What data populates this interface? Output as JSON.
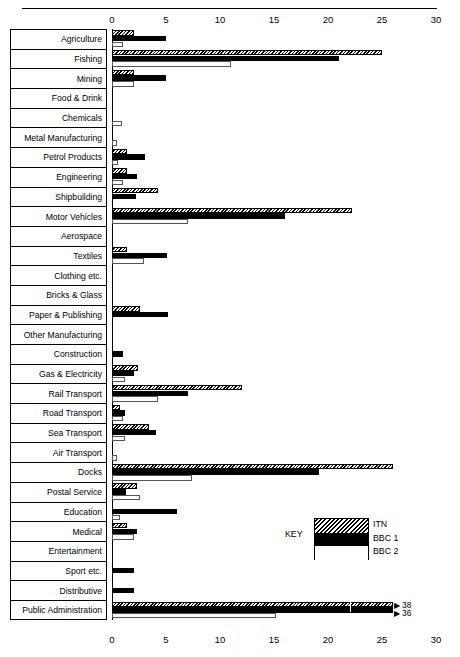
{
  "chart_data": {
    "type": "bar",
    "orientation": "horizontal",
    "title": "",
    "subtitle": "",
    "xlabel": "",
    "ylabel": "",
    "xlim": [
      0,
      30
    ],
    "xticks": [
      0,
      5,
      10,
      15,
      20,
      25,
      30
    ],
    "xtick_labels": [
      "0",
      "5",
      "10",
      "15",
      "20",
      "25",
      "30"
    ],
    "grid": false,
    "legend_position": "inside-right",
    "legend_title": "KEY",
    "categories": [
      "Agriculture",
      "Fishing",
      "Mining",
      "Food & Drink",
      "Chemicals",
      "Metal Manufacturing",
      "Petrol Products",
      "Engineering",
      "Shipbuilding",
      "Motor Vehicles",
      "Aerospace",
      "Textiles",
      "Clothing etc.",
      "Bricks & Glass",
      "Paper & Publishing",
      "Other Manufacturing",
      "Construction",
      "Gas & Electricity",
      "Rail Transport",
      "Road Transport",
      "Sea Transport",
      "Air Transport",
      "Docks",
      "Postal Service",
      "Education",
      "Medical",
      "Entertainment",
      "Sport etc.",
      "Distributive",
      "Public Administration"
    ],
    "series": [
      {
        "name": "ITN",
        "pattern": "diagonal-hatch",
        "values": [
          2.0,
          25.0,
          2.0,
          0.0,
          0.0,
          0.0,
          1.4,
          1.4,
          4.3,
          22.2,
          0.0,
          1.4,
          0.0,
          0.0,
          2.6,
          0.0,
          0.0,
          2.4,
          12.0,
          0.7,
          3.4,
          0.0,
          26.0,
          2.3,
          0.0,
          1.4,
          0.0,
          0.0,
          0.0,
          38.0
        ],
        "overflow": [
          false,
          false,
          false,
          false,
          false,
          false,
          false,
          false,
          false,
          false,
          false,
          false,
          false,
          false,
          false,
          false,
          false,
          false,
          false,
          false,
          false,
          false,
          false,
          false,
          false,
          false,
          false,
          false,
          false,
          true
        ],
        "overflow_label": "38"
      },
      {
        "name": "BBC 1",
        "pattern": "solid-black",
        "values": [
          5.0,
          21.0,
          5.0,
          0.0,
          0.0,
          0.0,
          3.1,
          2.3,
          2.2,
          16.0,
          0.0,
          5.1,
          0.0,
          0.0,
          5.2,
          0.0,
          1.0,
          2.0,
          7.0,
          1.2,
          4.1,
          0.0,
          19.2,
          1.3,
          6.0,
          2.3,
          0.0,
          2.0,
          2.0,
          36.0
        ],
        "overflow": [
          false,
          false,
          false,
          false,
          false,
          false,
          false,
          false,
          false,
          false,
          false,
          false,
          false,
          false,
          false,
          false,
          false,
          false,
          false,
          false,
          false,
          false,
          false,
          false,
          false,
          false,
          false,
          false,
          false,
          true
        ],
        "overflow_label": "36"
      },
      {
        "name": "BBC 2",
        "pattern": "white-outline",
        "values": [
          1.0,
          11.0,
          2.0,
          0.0,
          0.9,
          0.5,
          0.6,
          1.0,
          0.0,
          7.0,
          0.0,
          3.0,
          0.0,
          0.0,
          0.0,
          0.0,
          0.0,
          1.2,
          4.3,
          1.0,
          1.2,
          0.5,
          7.4,
          2.6,
          0.7,
          2.0,
          0.0,
          0.0,
          0.0,
          15.2
        ],
        "overflow": [
          false,
          false,
          false,
          false,
          false,
          false,
          false,
          false,
          false,
          false,
          false,
          false,
          false,
          false,
          false,
          false,
          false,
          false,
          false,
          false,
          false,
          false,
          false,
          false,
          false,
          false,
          false,
          false,
          false,
          false
        ],
        "overflow_label": ""
      }
    ],
    "annotations": [
      {
        "text": "38",
        "series": "ITN",
        "category": "Public Administration"
      },
      {
        "text": "36",
        "series": "BBC 1",
        "category": "Public Administration"
      }
    ]
  },
  "legend": {
    "key_label": "KEY",
    "entries": [
      "ITN",
      "BBC 1",
      "BBC 2"
    ]
  }
}
